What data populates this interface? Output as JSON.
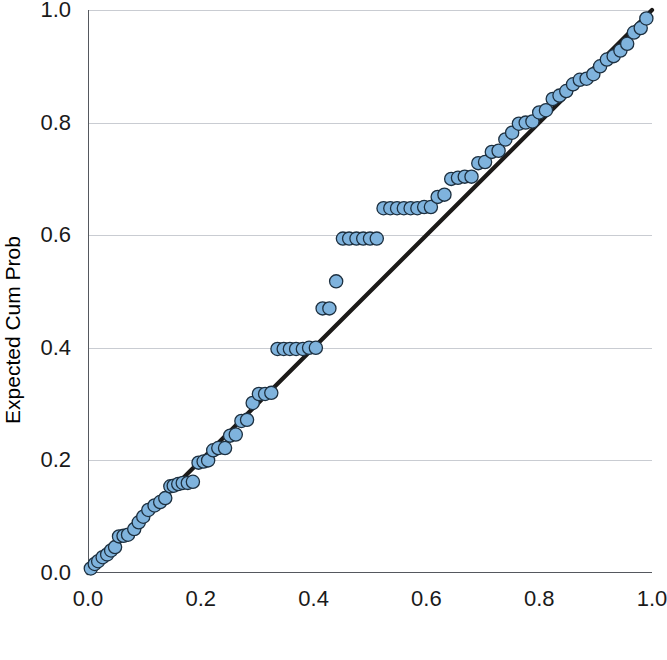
{
  "chart_data": {
    "type": "scatter",
    "title": "",
    "subtitle": "",
    "xlabel": "Observed Cum Prob",
    "ylabel": "Expected Cum Prob",
    "xlim": [
      0.0,
      1.0
    ],
    "ylim": [
      0.0,
      1.0
    ],
    "xticks": [
      "0.0",
      "0.2",
      "0.4",
      "0.6",
      "0.8",
      "1.0"
    ],
    "yticks": [
      "0.0",
      "0.2",
      "0.4",
      "0.6",
      "0.8",
      "1.0"
    ],
    "xtick_values": [
      0.0,
      0.2,
      0.4,
      0.6,
      0.8,
      1.0
    ],
    "ytick_values": [
      0.0,
      0.2,
      0.4,
      0.6,
      0.8,
      1.0
    ],
    "grid": "horizontal",
    "legend": "none",
    "annotations": [],
    "marker_color": "#7fb3dd",
    "marker_edge_color": "#1d3040",
    "reference_line_color": "#1c1a18",
    "gridline_color": "#c9ccd2",
    "axis_color": "#55585e",
    "background_color": "#ffffff",
    "series": [
      {
        "name": "Reference line",
        "type": "line",
        "x": [
          0.0,
          1.0
        ],
        "y": [
          0.0,
          1.0
        ]
      },
      {
        "name": "Cases",
        "type": "scatter",
        "x": [
          0.005,
          0.012,
          0.018,
          0.026,
          0.034,
          0.041,
          0.048,
          0.055,
          0.063,
          0.071,
          0.082,
          0.09,
          0.098,
          0.107,
          0.118,
          0.128,
          0.137,
          0.146,
          0.152,
          0.16,
          0.168,
          0.177,
          0.186,
          0.196,
          0.205,
          0.213,
          0.222,
          0.231,
          0.243,
          0.252,
          0.262,
          0.272,
          0.282,
          0.292,
          0.303,
          0.314,
          0.325,
          0.336,
          0.347,
          0.358,
          0.369,
          0.381,
          0.392,
          0.404,
          0.416,
          0.428,
          0.44,
          0.452,
          0.463,
          0.476,
          0.488,
          0.5,
          0.512,
          0.524,
          0.536,
          0.548,
          0.56,
          0.572,
          0.584,
          0.596,
          0.608,
          0.62,
          0.632,
          0.644,
          0.656,
          0.668,
          0.68,
          0.692,
          0.704,
          0.716,
          0.728,
          0.74,
          0.752,
          0.764,
          0.776,
          0.788,
          0.8,
          0.812,
          0.824,
          0.836,
          0.848,
          0.86,
          0.872,
          0.884,
          0.896,
          0.908,
          0.92,
          0.932,
          0.944,
          0.956,
          0.968,
          0.98,
          0.99
        ],
        "y": [
          0.008,
          0.016,
          0.021,
          0.028,
          0.033,
          0.04,
          0.046,
          0.065,
          0.066,
          0.068,
          0.078,
          0.09,
          0.1,
          0.112,
          0.12,
          0.126,
          0.133,
          0.154,
          0.155,
          0.158,
          0.16,
          0.16,
          0.162,
          0.196,
          0.198,
          0.2,
          0.218,
          0.222,
          0.222,
          0.244,
          0.246,
          0.27,
          0.272,
          0.302,
          0.318,
          0.318,
          0.32,
          0.398,
          0.398,
          0.398,
          0.398,
          0.398,
          0.4,
          0.4,
          0.47,
          0.47,
          0.518,
          0.594,
          0.594,
          0.594,
          0.594,
          0.594,
          0.594,
          0.648,
          0.648,
          0.648,
          0.648,
          0.648,
          0.648,
          0.65,
          0.65,
          0.668,
          0.672,
          0.7,
          0.702,
          0.704,
          0.704,
          0.728,
          0.73,
          0.748,
          0.75,
          0.77,
          0.782,
          0.798,
          0.8,
          0.802,
          0.818,
          0.822,
          0.842,
          0.848,
          0.856,
          0.868,
          0.876,
          0.878,
          0.886,
          0.9,
          0.912,
          0.918,
          0.928,
          0.94,
          0.96,
          0.968,
          0.985
        ]
      }
    ]
  }
}
